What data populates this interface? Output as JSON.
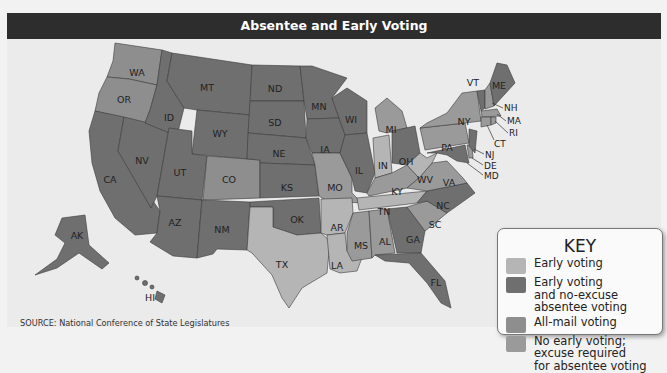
{
  "title": "Absentee and Early Voting",
  "source": "SOURCE: National Conference of State Legislatures",
  "key": {
    "title": "KEY",
    "items": [
      {
        "id": "early",
        "label": "Early voting",
        "color": "#b5b5b5"
      },
      {
        "id": "early_noexcuse",
        "label": "Early voting\nand no-excuse\nabsentee voting",
        "color": "#6f6f6f"
      },
      {
        "id": "allmail",
        "label": "All-mail voting",
        "color": "#8e8e8e"
      },
      {
        "id": "none",
        "label": "No early voting;\nexcuse required\nfor absentee voting",
        "color": "#9a9a9a"
      }
    ]
  },
  "states": {
    "WA": "allmail",
    "OR": "allmail",
    "CO": "allmail",
    "TX": "early",
    "AR": "early",
    "LA": "early",
    "TN": "early",
    "IN": "early",
    "WV": "early",
    "CA": "early_noexcuse",
    "NV": "early_noexcuse",
    "ID": "early_noexcuse",
    "MT": "early_noexcuse",
    "WY": "early_noexcuse",
    "UT": "early_noexcuse",
    "AZ": "early_noexcuse",
    "NM": "early_noexcuse",
    "ND": "early_noexcuse",
    "SD": "early_noexcuse",
    "NE": "early_noexcuse",
    "KS": "early_noexcuse",
    "OK": "early_noexcuse",
    "MN": "early_noexcuse",
    "IA": "early_noexcuse",
    "WI": "early_noexcuse",
    "IL": "early_noexcuse",
    "OH": "early_noexcuse",
    "GA": "early_noexcuse",
    "FL": "early_noexcuse",
    "NC": "early_noexcuse",
    "MD": "early_noexcuse",
    "NJ": "early_noexcuse",
    "VT": "early_noexcuse",
    "ME": "early_noexcuse",
    "AK": "early_noexcuse",
    "HI": "early_noexcuse",
    "MO": "none",
    "KY": "none",
    "VA": "none",
    "MS": "none",
    "AL": "none",
    "SC": "none",
    "MI": "none",
    "PA": "none",
    "NY": "none",
    "NH": "none",
    "MA": "none",
    "RI": "none",
    "CT": "none",
    "DE": "none"
  },
  "labels": {
    "WA": "WA",
    "OR": "OR",
    "CA": "CA",
    "NV": "NV",
    "ID": "ID",
    "MT": "MT",
    "WY": "WY",
    "UT": "UT",
    "CO": "CO",
    "AZ": "AZ",
    "NM": "NM",
    "ND": "ND",
    "SD": "SD",
    "NE": "NE",
    "KS": "KS",
    "OK": "OK",
    "TX": "TX",
    "MN": "MN",
    "IA": "IA",
    "MO": "MO",
    "AR": "AR",
    "LA": "LA",
    "WI": "WI",
    "IL": "IL",
    "MI": "MI",
    "IN": "IN",
    "OH": "OH",
    "KY": "KY",
    "TN": "TN",
    "MS": "MS",
    "AL": "AL",
    "GA": "GA",
    "FL": "FL",
    "SC": "SC",
    "NC": "NC",
    "VA": "VA",
    "WV": "WV",
    "PA": "PA",
    "NY": "NY",
    "VT": "VT",
    "ME": "ME",
    "NH": "NH",
    "MA": "MA",
    "RI": "RI",
    "CT": "CT",
    "NJ": "NJ",
    "DE": "DE",
    "MD": "MD",
    "AK": "AK",
    "HI": "HI"
  }
}
